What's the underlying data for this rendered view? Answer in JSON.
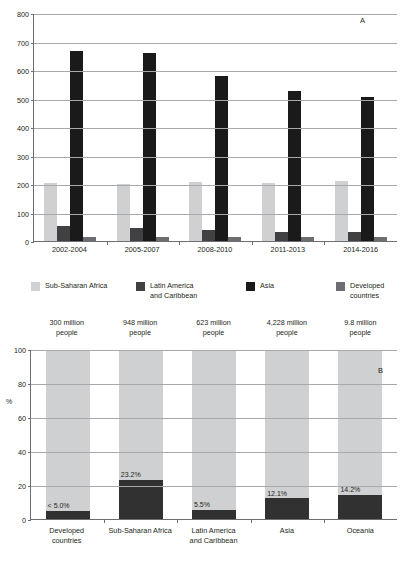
{
  "chart_data": [
    {
      "id": "panel-a",
      "type": "bar",
      "panel_label": "A",
      "title": "",
      "xlabel": "",
      "ylabel": "",
      "ylim": [
        0,
        800
      ],
      "yticks": [
        0,
        100,
        200,
        300,
        400,
        500,
        600,
        700,
        800
      ],
      "grid": true,
      "legend_position": "bottom",
      "categories": [
        "2002-2004",
        "2005-2007",
        "2008-2010",
        "2011-2013",
        "2014-2016"
      ],
      "series": [
        {
          "name": "Sub-Saharan Africa",
          "color": "#cfd0d2",
          "values": [
            205,
            199,
            206,
            203,
            210
          ]
        },
        {
          "name": "Latin America\nand Caribbean",
          "color": "#414042",
          "values": [
            53,
            46,
            40,
            33,
            32
          ]
        },
        {
          "name": "Asia",
          "color": "#1a1a1a",
          "values": [
            665,
            659,
            579,
            528,
            505
          ]
        },
        {
          "name": "Developed countries",
          "color": "#6d6e71",
          "values": [
            15,
            15,
            14,
            13,
            13
          ]
        }
      ]
    },
    {
      "id": "panel-b",
      "type": "bar",
      "panel_label": "B",
      "title": "",
      "xlabel": "",
      "ylabel": "%",
      "ylim": [
        0,
        100
      ],
      "yticks": [
        0,
        20,
        40,
        60,
        80,
        100
      ],
      "grid": true,
      "stacked": true,
      "categories": [
        "Developed\ncountries",
        "Sub-Saharan Africa",
        "Latin America\nand Caribbean",
        "Asia",
        "Oceania"
      ],
      "headers": [
        "300 million\npeople",
        "948 million\npeople",
        "623 million\npeople",
        "4,228 million\npeople",
        "9.8 million\npeople"
      ],
      "series": [
        {
          "name": "Undernourished",
          "color": "#313131",
          "values": [
            5.0,
            23.2,
            5.5,
            12.1,
            14.2
          ],
          "labels": [
            "< 5.0%",
            "23.2%",
            "5.5%",
            "12.1%",
            "14.2%"
          ]
        },
        {
          "name": "Remainder",
          "color": "#cfd0d2",
          "values": [
            95.0,
            76.8,
            94.5,
            87.9,
            85.8
          ]
        }
      ]
    }
  ]
}
